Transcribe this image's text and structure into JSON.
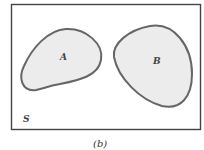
{
  "diagram": {
    "type": "venn",
    "universe_label": "S",
    "sets": [
      {
        "label": "A",
        "fill": "#ececec"
      },
      {
        "label": "B",
        "fill": "#ececec"
      }
    ],
    "relation": "disjoint",
    "caption": "(b)",
    "outline_color": "#666666",
    "frame_color": "#444444"
  }
}
